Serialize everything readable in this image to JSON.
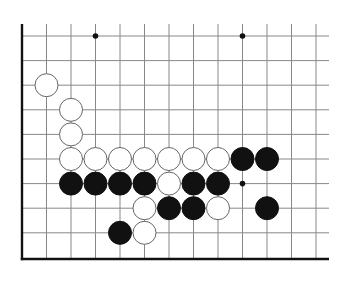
{
  "board": {
    "description": "Go board diagram, lower-left corner region",
    "colors": {
      "background": "#ffffff",
      "grid_line": "#888888",
      "edge_line": "#111111",
      "black_stone": "#111111",
      "white_stone": "#ffffff",
      "white_stone_outline": "#666666",
      "hoshi": "#111111"
    },
    "grid": {
      "columns_x": [
        22,
        46.5,
        71,
        95.5,
        120,
        144.5,
        169,
        193.5,
        218,
        242.5,
        267,
        291.5,
        316
      ],
      "rows_y": [
        36,
        60.6,
        85.2,
        109.8,
        134.4,
        159,
        183.6,
        208.2,
        232.8
      ],
      "top_extent_y": 24,
      "right_extent_x": 329,
      "bottom_edge_y": 259,
      "left_edge_x": 22
    },
    "hoshi": [
      {
        "col": 3,
        "row": 0
      },
      {
        "col": 9,
        "row": 0
      },
      {
        "col": 9,
        "row": 6
      }
    ],
    "stones": [
      {
        "color": "white",
        "col": 1,
        "row": 2
      },
      {
        "color": "white",
        "col": 2,
        "row": 3
      },
      {
        "color": "white",
        "col": 2,
        "row": 4
      },
      {
        "color": "white",
        "col": 2,
        "row": 5
      },
      {
        "color": "white",
        "col": 3,
        "row": 5
      },
      {
        "color": "white",
        "col": 4,
        "row": 5
      },
      {
        "color": "white",
        "col": 5,
        "row": 5
      },
      {
        "color": "white",
        "col": 6,
        "row": 5
      },
      {
        "color": "white",
        "col": 7,
        "row": 5
      },
      {
        "color": "white",
        "col": 8,
        "row": 5
      },
      {
        "color": "black",
        "col": 9,
        "row": 5
      },
      {
        "color": "black",
        "col": 10,
        "row": 5
      },
      {
        "color": "black",
        "col": 2,
        "row": 6
      },
      {
        "color": "black",
        "col": 3,
        "row": 6
      },
      {
        "color": "black",
        "col": 4,
        "row": 6
      },
      {
        "color": "black",
        "col": 5,
        "row": 6
      },
      {
        "color": "white",
        "col": 6,
        "row": 6
      },
      {
        "color": "black",
        "col": 7,
        "row": 6
      },
      {
        "color": "black",
        "col": 8,
        "row": 6
      },
      {
        "color": "white",
        "col": 5,
        "row": 7
      },
      {
        "color": "black",
        "col": 6,
        "row": 7
      },
      {
        "color": "black",
        "col": 7,
        "row": 7
      },
      {
        "color": "white",
        "col": 8,
        "row": 7
      },
      {
        "color": "black",
        "col": 10,
        "row": 7
      },
      {
        "color": "black",
        "col": 4,
        "row": 8
      },
      {
        "color": "white",
        "col": 5,
        "row": 8
      }
    ],
    "stone_radius": 11.5
  }
}
